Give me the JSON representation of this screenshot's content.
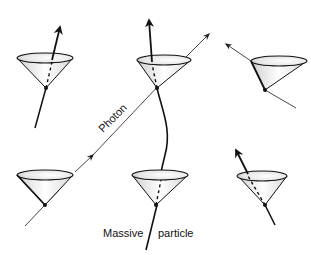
{
  "labels": {
    "photon": "Photon",
    "massive": "Massive",
    "particle": "particle"
  },
  "colors": {
    "ink": "#111111",
    "shade": "#9a9a9a",
    "background": "#ffffff"
  },
  "cones": [
    {
      "id": "top-left",
      "apex": [
        46,
        88
      ],
      "rim_center": [
        45,
        58
      ],
      "rx": 28,
      "ry": 5
    },
    {
      "id": "top-middle",
      "apex": [
        157,
        88
      ],
      "rim_center": [
        164,
        60
      ],
      "rx": 27,
      "ry": 5
    },
    {
      "id": "top-right",
      "apex": [
        265,
        90
      ],
      "rim_center": [
        279,
        61
      ],
      "rx": 28,
      "ry": 5
    },
    {
      "id": "bottom-left",
      "apex": [
        45,
        205
      ],
      "rim_center": [
        45,
        175
      ],
      "rx": 28,
      "ry": 5
    },
    {
      "id": "bottom-middle",
      "apex": [
        156,
        205
      ],
      "rim_center": [
        160,
        175
      ],
      "rx": 28,
      "ry": 5
    },
    {
      "id": "bottom-right",
      "apex": [
        265,
        205
      ],
      "rim_center": [
        258,
        176
      ],
      "rx": 28,
      "ry": 5
    }
  ]
}
